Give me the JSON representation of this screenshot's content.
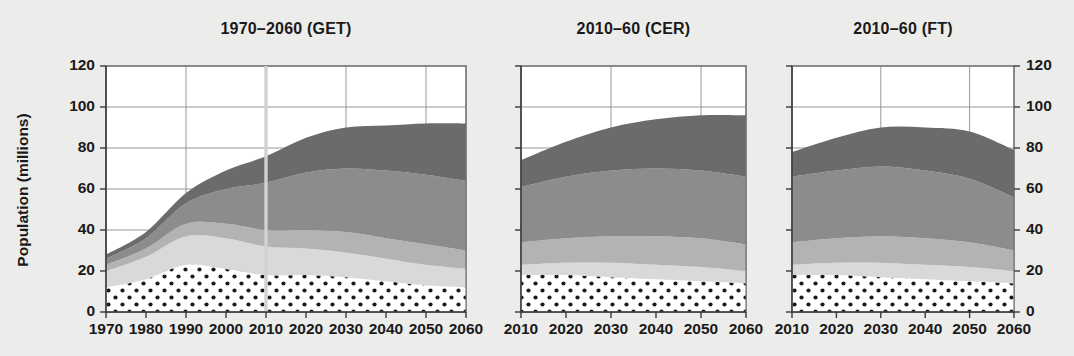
{
  "figure": {
    "background_color": "#ececeb",
    "y_axis_title": "Population (millions)",
    "y_ticks": [
      0,
      20,
      40,
      60,
      80,
      100,
      120
    ],
    "y_range": [
      0,
      120
    ],
    "series_colors": {
      "dotted": "#ffffff",
      "light": "#d9d9d9",
      "medium_light": "#b3b3b3",
      "medium": "#8c8c8c",
      "dark": "#6b6b6b"
    }
  },
  "chart_data": [
    {
      "type": "area",
      "title": "1970–2060 (GET)",
      "xlabel": "",
      "ylabel": "Population (millions)",
      "ylim": [
        0,
        120
      ],
      "xlim": [
        1970,
        2060
      ],
      "grid": true,
      "legend_position": "none",
      "x": [
        1970,
        1980,
        1990,
        2000,
        2010,
        2020,
        2030,
        2040,
        2050,
        2060
      ],
      "xticks": [
        "1970",
        "1980",
        "1990",
        "2000",
        "2010",
        "2020",
        "2030",
        "2040",
        "2050",
        "2060"
      ],
      "annotation_line_x": 2010,
      "stacked": true,
      "series": [
        {
          "name": "dotted",
          "values": [
            12,
            16,
            23,
            21,
            18,
            18,
            17,
            15,
            13,
            12
          ]
        },
        {
          "name": "light",
          "values": [
            8,
            11,
            14,
            15,
            14,
            13,
            12,
            11,
            10,
            9
          ]
        },
        {
          "name": "medium_light",
          "values": [
            3,
            4,
            6,
            7,
            8,
            9,
            10,
            10,
            10,
            9
          ]
        },
        {
          "name": "medium",
          "values": [
            3,
            5,
            10,
            17,
            23,
            28,
            31,
            33,
            34,
            34
          ]
        },
        {
          "name": "dark",
          "values": [
            2,
            3,
            5,
            9,
            13,
            17,
            20,
            22,
            25,
            28
          ]
        }
      ],
      "totals": [
        28,
        39,
        58,
        69,
        76,
        85,
        90,
        91,
        92,
        92
      ]
    },
    {
      "type": "area",
      "title": "2010–60 (CER)",
      "xlabel": "",
      "ylabel": "",
      "ylim": [
        0,
        120
      ],
      "xlim": [
        2010,
        2060
      ],
      "grid": true,
      "legend_position": "none",
      "x": [
        2010,
        2020,
        2030,
        2040,
        2050,
        2060
      ],
      "xticks": [
        "2010",
        "2020",
        "2030",
        "2040",
        "2050",
        "2060"
      ],
      "annotation_line_x": null,
      "stacked": true,
      "series": [
        {
          "name": "dotted",
          "values": [
            18,
            18,
            17,
            16,
            15,
            14
          ]
        },
        {
          "name": "light",
          "values": [
            5,
            6,
            7,
            7,
            7,
            6
          ]
        },
        {
          "name": "medium_light",
          "values": [
            11,
            12,
            13,
            14,
            14,
            13
          ]
        },
        {
          "name": "medium",
          "values": [
            27,
            30,
            32,
            33,
            33,
            33
          ]
        },
        {
          "name": "dark",
          "values": [
            13,
            17,
            21,
            24,
            27,
            30
          ]
        }
      ],
      "totals": [
        74,
        83,
        90,
        94,
        96,
        96
      ]
    },
    {
      "type": "area",
      "title": "2010–60 (FT)",
      "xlabel": "",
      "ylabel": "",
      "ylim": [
        0,
        120
      ],
      "xlim": [
        2010,
        2060
      ],
      "grid": true,
      "legend_position": "none",
      "x": [
        2010,
        2020,
        2030,
        2040,
        2050,
        2060
      ],
      "xticks": [
        "2010",
        "2020",
        "2030",
        "2040",
        "2050",
        "2060"
      ],
      "annotation_line_x": null,
      "stacked": true,
      "series": [
        {
          "name": "dotted",
          "values": [
            18,
            18,
            17,
            16,
            15,
            14
          ]
        },
        {
          "name": "light",
          "values": [
            5,
            6,
            7,
            7,
            7,
            6
          ]
        },
        {
          "name": "medium_light",
          "values": [
            11,
            12,
            13,
            13,
            12,
            10
          ]
        },
        {
          "name": "medium",
          "values": [
            32,
            33,
            34,
            33,
            31,
            26
          ]
        },
        {
          "name": "dark",
          "values": [
            12,
            16,
            19,
            21,
            23,
            23
          ]
        }
      ],
      "totals": [
        78,
        85,
        90,
        90,
        88,
        79
      ]
    }
  ]
}
